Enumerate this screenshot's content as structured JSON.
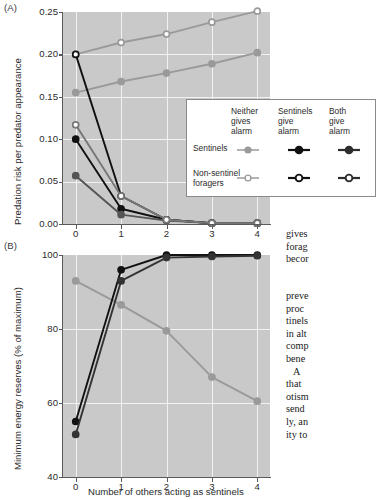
{
  "figure": {
    "panel_a_label": "(A)",
    "panel_b_label": "(B)"
  },
  "legend": {
    "columns": [
      {
        "id": "neither",
        "label": "Neither\ngives\nalarm"
      },
      {
        "id": "sentinels",
        "label": "Sentinels\ngive\nalarm"
      },
      {
        "id": "both",
        "label": "Both\ngive\nalarm"
      }
    ],
    "rows": [
      {
        "id": "sentinels",
        "label": "Sentinels",
        "marker": "filled-circle"
      },
      {
        "id": "non-sentinel-foragers",
        "label": "Non-sentinel\nforagers",
        "marker": "open-circle"
      }
    ],
    "colors": {
      "neither": "#9a9a9a",
      "sentinels": "#111111",
      "both": "#2e2e2e"
    }
  },
  "body_text": {
    "column_1": "gives\nforag\nbecor",
    "column_2": "preve\nproc\ntinels\nin alt\ncomp\nbene\n   A\nthat\notism\nsend\nly, an\nity to"
  },
  "chart_data": [
    {
      "type": "line",
      "panel": "A",
      "title": "",
      "xlabel": "",
      "ylabel": "Predation risk per predator appearance",
      "x": [
        0,
        1,
        2,
        3,
        4
      ],
      "xticklabels": [
        "0",
        "1",
        "2",
        "3",
        "4"
      ],
      "xlim": [
        -0.28,
        4.28
      ],
      "ylim": [
        0.0,
        0.25
      ],
      "yticks": [
        0.0,
        0.05,
        0.1,
        0.15,
        0.2,
        0.25
      ],
      "yticklabels": [
        "0.00",
        "0.05",
        "0.10",
        "0.15",
        "0.20",
        "0.25"
      ],
      "grid": true,
      "background": "#c9c9c9",
      "gridcolor": "#f2f2f2",
      "series": [
        {
          "name": "Sentinels — Neither gives alarm",
          "color": "#9a9a9a",
          "marker": "filled-circle",
          "values": [
            0.155,
            0.168,
            0.178,
            0.189,
            0.202
          ]
        },
        {
          "name": "Non-sentinel foragers — Neither gives alarm",
          "color": "#9a9a9a",
          "marker": "open-circle",
          "values": [
            0.2,
            0.214,
            0.224,
            0.238,
            0.251
          ]
        },
        {
          "name": "Non-sentinel foragers — Sentinels give alarm",
          "color": "#111111",
          "marker": "open-circle",
          "values": [
            0.2,
            0.033,
            0.005,
            0.001,
            0.001
          ]
        },
        {
          "name": "Sentinels — Sentinels give alarm",
          "color": "#111111",
          "marker": "filled-circle",
          "values": [
            0.1,
            0.018,
            0.005,
            0.001,
            0.001
          ]
        },
        {
          "name": "Sentinels — Both give alarm",
          "color": "#555555",
          "marker": "filled-circle",
          "values": [
            0.057,
            0.011,
            0.004,
            0.001,
            0.001
          ]
        },
        {
          "name": "Non-sentinel foragers — Both give alarm",
          "color": "#777777",
          "marker": "open-circle",
          "values": [
            0.117,
            0.033,
            0.005,
            0.001,
            0.001
          ]
        }
      ]
    },
    {
      "type": "line",
      "panel": "B",
      "title": "",
      "xlabel": "Number of others acting as sentinels",
      "ylabel": "Minimum energy reserves (% of maximum)",
      "x": [
        0,
        1,
        2,
        3,
        4
      ],
      "xticklabels": [
        "0",
        "1",
        "2",
        "3",
        "4"
      ],
      "xlim": [
        -0.28,
        4.28
      ],
      "ylim": [
        40,
        100
      ],
      "yticks": [
        40,
        60,
        80,
        100
      ],
      "yticklabels": [
        "40",
        "60",
        "80",
        "100"
      ],
      "grid": true,
      "background": "#c9c9c9",
      "gridcolor": "#f2f2f2",
      "series": [
        {
          "name": "Neither gives alarm",
          "color": "#9a9a9a",
          "marker": "filled-circle",
          "values": [
            93.0,
            86.5,
            79.5,
            67.0,
            60.5
          ]
        },
        {
          "name": "Sentinels give alarm",
          "color": "#111111",
          "marker": "filled-circle",
          "values": [
            55.0,
            96.0,
            100.0,
            100.0,
            100.0
          ]
        },
        {
          "name": "Both give alarm",
          "color": "#333333",
          "marker": "filled-circle",
          "values": [
            51.5,
            93.0,
            99.3,
            99.6,
            99.8
          ]
        }
      ]
    }
  ]
}
